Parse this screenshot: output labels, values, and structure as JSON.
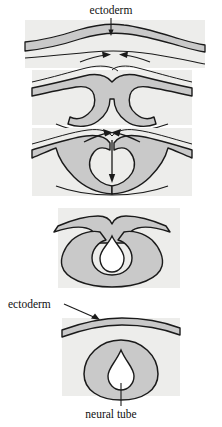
{
  "figure": {
    "background_color": "#ffffff",
    "tissue_fill_color": "#c9c9c9",
    "panel_fill_color": "#ededeb",
    "outline_color": "#1a1a1a",
    "lumen_fill_color": "#ffffff"
  },
  "labels": {
    "ectoderm_top": "ectoderm",
    "ectoderm_bottom": "ectoderm",
    "neural_tube": "neural tube"
  },
  "panels": [
    {
      "index": 1,
      "name": "flat-neural-plate",
      "description": "flat ectoderm sheet with neural plate thickening",
      "arrows": [
        "arrow-right-inward",
        "arrow-left-inward"
      ]
    },
    {
      "index": 2,
      "name": "neural-groove",
      "description": "ectoderm folds forming neural groove",
      "arrows": []
    },
    {
      "index": 3,
      "name": "neural-folds-converging",
      "description": "neural folds rise and converge toward midline",
      "arrows": [
        "arrow-converge-left",
        "arrow-converge-right",
        "arrow-down-midline"
      ]
    },
    {
      "index": 4,
      "name": "neural-tube-closing",
      "description": "neural folds fuse, tube nearly closed",
      "arrows": []
    },
    {
      "index": 5,
      "name": "neural-tube-closed",
      "description": "closed neural tube beneath surface ectoderm",
      "arrows": []
    }
  ]
}
